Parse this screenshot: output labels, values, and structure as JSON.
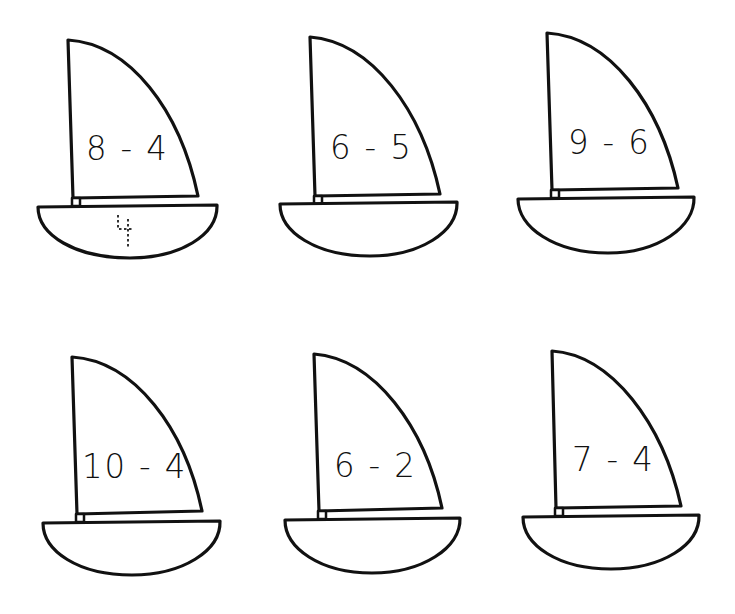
{
  "worksheet": {
    "title": "Sailboat subtraction",
    "boats": [
      {
        "id": "boat-1",
        "problem": "8 - 4",
        "answer": "4",
        "answer_style": "dotted-trace"
      },
      {
        "id": "boat-2",
        "problem": "6 - 5",
        "answer": ""
      },
      {
        "id": "boat-3",
        "problem": "9 - 6",
        "answer": ""
      },
      {
        "id": "boat-4",
        "problem": "10 - 4",
        "answer": ""
      },
      {
        "id": "boat-5",
        "problem": "6 - 2",
        "answer": ""
      },
      {
        "id": "boat-6",
        "problem": "7 - 4",
        "answer": ""
      }
    ],
    "colors": {
      "ink": "#111111",
      "paper": "#ffffff"
    }
  }
}
